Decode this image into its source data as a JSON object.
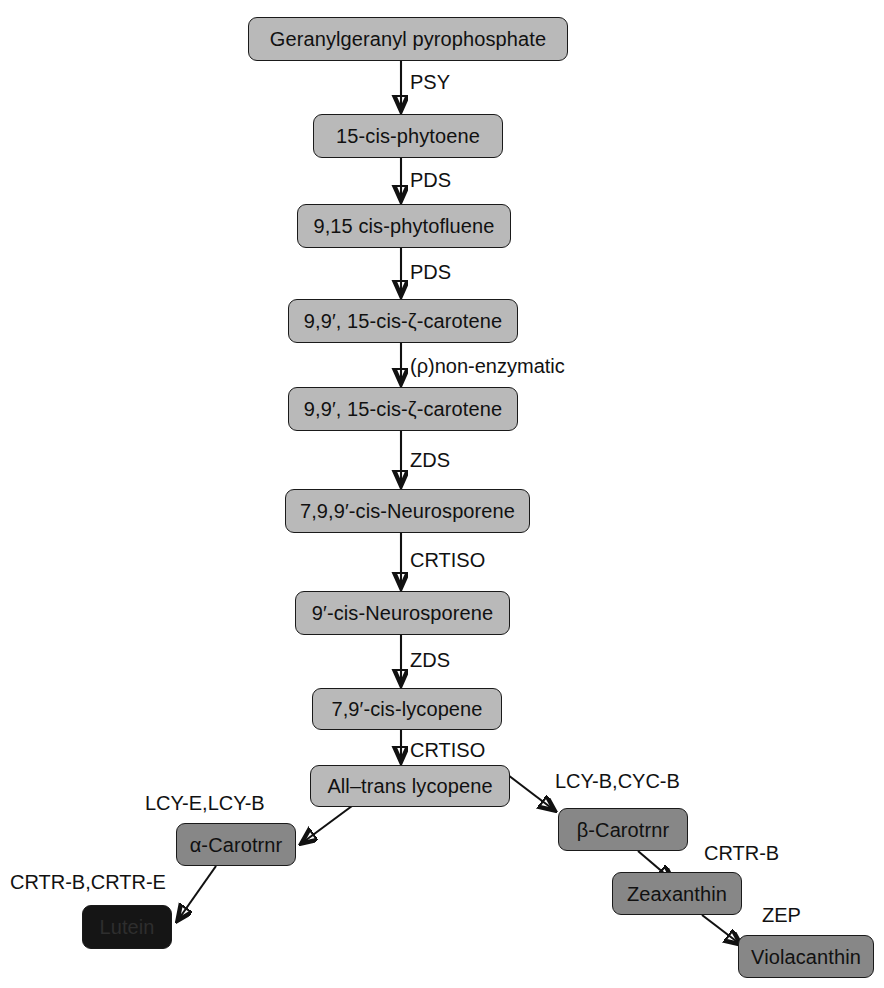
{
  "diagram": {
    "colors": {
      "light_box": "#b9b9b9",
      "dark_box": "#878787",
      "black_box": "#151515",
      "stroke": "#111111",
      "background": "#ffffff"
    },
    "nodes": [
      {
        "id": "ggpp",
        "label": "Geranylgeranyl pyrophosphate",
        "shade": "light",
        "x": 248,
        "y": 17,
        "w": 320,
        "h": 44
      },
      {
        "id": "phytoene",
        "label": "15-cis-phytoene",
        "shade": "light",
        "x": 313,
        "y": 114,
        "w": 190,
        "h": 44
      },
      {
        "id": "phytofluene",
        "label": "9,15 cis-phytofluene",
        "shade": "light",
        "x": 297,
        "y": 204,
        "w": 214,
        "h": 44
      },
      {
        "id": "zcarotene1",
        "label": "9,9′, 15-cis-ζ-carotene",
        "shade": "light",
        "x": 288,
        "y": 299,
        "w": 230,
        "h": 44
      },
      {
        "id": "zcarotene2",
        "label": "9,9′, 15-cis-ζ-carotene",
        "shade": "light",
        "x": 288,
        "y": 387,
        "w": 230,
        "h": 44
      },
      {
        "id": "neuro1",
        "label": "7,9,9′-cis-Neurosporene",
        "shade": "light",
        "x": 285,
        "y": 489,
        "w": 245,
        "h": 44
      },
      {
        "id": "neuro2",
        "label": "9′-cis-Neurosporene",
        "shade": "light",
        "x": 295,
        "y": 591,
        "w": 215,
        "h": 44
      },
      {
        "id": "lycopene79",
        "label": "7,9′-cis-lycopene",
        "shade": "light",
        "x": 312,
        "y": 688,
        "w": 190,
        "h": 42
      },
      {
        "id": "alltrans",
        "label": "All–trans lycopene",
        "shade": "light",
        "x": 310,
        "y": 765,
        "w": 200,
        "h": 42
      },
      {
        "id": "alphacar",
        "label": "α-Carotrnr",
        "shade": "dark",
        "x": 176,
        "y": 823,
        "w": 120,
        "h": 43
      },
      {
        "id": "lutein",
        "label": "Lutein",
        "shade": "black",
        "x": 82,
        "y": 905,
        "w": 90,
        "h": 44
      },
      {
        "id": "betacar",
        "label": "β-Carotrnr",
        "shade": "dark",
        "x": 558,
        "y": 808,
        "w": 130,
        "h": 43
      },
      {
        "id": "zeaxanthin",
        "label": "Zeaxanthin",
        "shade": "dark",
        "x": 612,
        "y": 872,
        "w": 130,
        "h": 43
      },
      {
        "id": "violaxanthin",
        "label": "Violacanthin",
        "shade": "dark",
        "x": 738,
        "y": 935,
        "w": 136,
        "h": 43
      }
    ],
    "enzymes": [
      {
        "id": "psy1",
        "label": "PSY",
        "x": 401,
        "y": 72
      },
      {
        "id": "pds1",
        "label": "PDS",
        "x": 401,
        "y": 170
      },
      {
        "id": "pds2",
        "label": "PDS",
        "x": 401,
        "y": 262
      },
      {
        "id": "nonenzym",
        "label": "(ρ)non-enzymatic",
        "x": 401,
        "y": 356
      },
      {
        "id": "zds1",
        "label": "ZDS",
        "x": 401,
        "y": 450
      },
      {
        "id": "crtiso1",
        "label": "CRTISO",
        "x": 401,
        "y": 550
      },
      {
        "id": "zds2",
        "label": "ZDS",
        "x": 401,
        "y": 650
      },
      {
        "id": "crtiso2",
        "label": "CRTISO",
        "x": 401,
        "y": 740
      },
      {
        "id": "lcye_lcyb",
        "label": "LCY-E,LCY-B",
        "x": 145,
        "y": 793
      },
      {
        "id": "lcyb_cycb",
        "label": "LCY-B,CYC-B",
        "x": 555,
        "y": 771
      },
      {
        "id": "crtrb_crtre",
        "label": "CRTR-B,CRTR-E",
        "x": 10,
        "y": 872
      },
      {
        "id": "crtrb",
        "label": "CRTR-B",
        "x": 704,
        "y": 843
      },
      {
        "id": "zep",
        "label": "ZEP",
        "x": 762,
        "y": 905
      }
    ],
    "edges": [
      {
        "id": "e-ggpp-phytoene",
        "from": "ggpp",
        "to": "phytoene",
        "enzyme": "PSY"
      },
      {
        "id": "e-phytoene-fluene",
        "from": "phytoene",
        "to": "phytofluene",
        "enzyme": "PDS"
      },
      {
        "id": "e-fluene-zcar1",
        "from": "phytofluene",
        "to": "zcarotene1",
        "enzyme": "PDS"
      },
      {
        "id": "e-zcar1-zcar2",
        "from": "zcarotene1",
        "to": "zcarotene2",
        "enzyme": "(ρ)non-enzymatic"
      },
      {
        "id": "e-zcar2-neuro1",
        "from": "zcarotene2",
        "to": "neuro1",
        "enzyme": "ZDS"
      },
      {
        "id": "e-neuro1-neuro2",
        "from": "neuro1",
        "to": "neuro2",
        "enzyme": "CRTISO"
      },
      {
        "id": "e-neuro2-lyco79",
        "from": "neuro2",
        "to": "lycopene79",
        "enzyme": "ZDS"
      },
      {
        "id": "e-lyco79-alltrans",
        "from": "lycopene79",
        "to": "alltrans",
        "enzyme": "CRTISO"
      },
      {
        "id": "e-alltrans-alpha",
        "from": "alltrans",
        "to": "alphacar",
        "enzyme": "LCY-E,LCY-B"
      },
      {
        "id": "e-alpha-lutein",
        "from": "alphacar",
        "to": "lutein",
        "enzyme": "CRTR-B,CRTR-E"
      },
      {
        "id": "e-alltrans-beta",
        "from": "alltrans",
        "to": "betacar",
        "enzyme": "LCY-B,CYC-B"
      },
      {
        "id": "e-beta-zea",
        "from": "betacar",
        "to": "zeaxanthin",
        "enzyme": "CRTR-B"
      },
      {
        "id": "e-zea-viola",
        "from": "zeaxanthin",
        "to": "violaxanthin",
        "enzyme": "ZEP"
      }
    ]
  }
}
